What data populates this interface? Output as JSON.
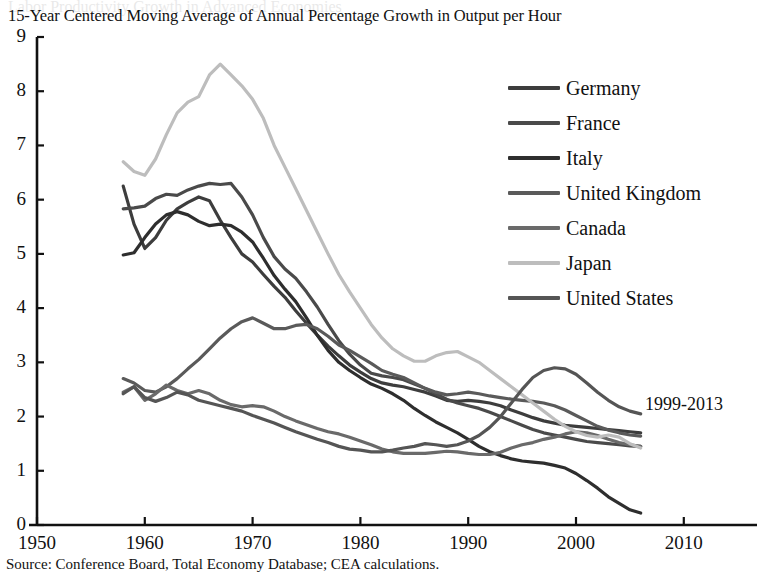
{
  "chart_data": {
    "type": "line",
    "title": "Labor Productivity Growth in Advanced Economies",
    "subtitle": "15-Year Centered Moving Average of Annual Percentage Growth in Output per Hour",
    "source": "Source: Conference Board, Total Economy Database; CEA calculations.",
    "annotation": "1999-2013",
    "xlabel": "",
    "ylabel": "",
    "xlim": [
      1950,
      2015
    ],
    "ylim": [
      0,
      9
    ],
    "xticks": [
      1950,
      1960,
      1970,
      1980,
      1990,
      2000,
      2010
    ],
    "yticks": [
      0,
      1,
      2,
      3,
      4,
      5,
      6,
      7,
      8,
      9
    ],
    "xtick_labels": [
      "1950",
      "1960",
      "1970",
      "1980",
      "1990",
      "2000",
      "2010"
    ],
    "ytick_labels": [
      "0",
      "1",
      "2",
      "3",
      "4",
      "5",
      "6",
      "7",
      "8",
      "9"
    ],
    "grid": false,
    "legend_position": "upper right",
    "x_start": 1958,
    "x_end": 2006,
    "series": [
      {
        "name": "Germany",
        "color": "#3d3d3d",
        "x": [
          1958,
          1959,
          1960,
          1961,
          1962,
          1963,
          1964,
          1965,
          1966,
          1967,
          1968,
          1969,
          1970,
          1971,
          1972,
          1973,
          1974,
          1975,
          1976,
          1977,
          1978,
          1979,
          1980,
          1981,
          1982,
          1983,
          1984,
          1985,
          1986,
          1987,
          1988,
          1989,
          1990,
          1991,
          1992,
          1993,
          1994,
          1995,
          1996,
          1997,
          1998,
          1999,
          2000,
          2001,
          2002,
          2003,
          2004,
          2005,
          2006
        ],
        "values": [
          6.25,
          5.55,
          5.1,
          5.3,
          5.62,
          5.83,
          5.95,
          6.05,
          5.98,
          5.62,
          5.3,
          5.0,
          4.85,
          4.62,
          4.4,
          4.2,
          3.95,
          3.72,
          3.5,
          3.3,
          3.12,
          2.95,
          2.82,
          2.7,
          2.62,
          2.58,
          2.55,
          2.5,
          2.45,
          2.38,
          2.3,
          2.28,
          2.3,
          2.28,
          2.25,
          2.2,
          2.12,
          2.05,
          1.98,
          1.92,
          1.88,
          1.84,
          1.82,
          1.8,
          1.78,
          1.76,
          1.74,
          1.72,
          1.7
        ]
      },
      {
        "name": "France",
        "color": "#4a4a4a",
        "x": [
          1958,
          1959,
          1960,
          1961,
          1962,
          1963,
          1964,
          1965,
          1966,
          1967,
          1968,
          1969,
          1970,
          1971,
          1972,
          1973,
          1974,
          1975,
          1976,
          1977,
          1978,
          1979,
          1980,
          1981,
          1982,
          1983,
          1984,
          1985,
          1986,
          1987,
          1988,
          1989,
          1990,
          1991,
          1992,
          1993,
          1994,
          1995,
          1996,
          1997,
          1998,
          1999,
          2000,
          2001,
          2002,
          2003,
          2004,
          2005,
          2006
        ],
        "values": [
          5.83,
          5.85,
          5.88,
          6.02,
          6.1,
          6.08,
          6.18,
          6.25,
          6.3,
          6.28,
          6.3,
          6.05,
          5.72,
          5.3,
          4.95,
          4.72,
          4.55,
          4.3,
          4.02,
          3.7,
          3.4,
          3.15,
          2.95,
          2.8,
          2.75,
          2.72,
          2.68,
          2.6,
          2.52,
          2.42,
          2.32,
          2.25,
          2.2,
          2.15,
          2.08,
          2.0,
          1.92,
          1.84,
          1.76,
          1.7,
          1.66,
          1.62,
          1.58,
          1.54,
          1.52,
          1.5,
          1.48,
          1.46,
          1.45
        ]
      },
      {
        "name": "Italy",
        "color": "#2e2e2e",
        "x": [
          1958,
          1959,
          1960,
          1961,
          1962,
          1963,
          1964,
          1965,
          1966,
          1967,
          1968,
          1969,
          1970,
          1971,
          1972,
          1973,
          1974,
          1975,
          1976,
          1977,
          1978,
          1979,
          1980,
          1981,
          1982,
          1983,
          1984,
          1985,
          1986,
          1987,
          1988,
          1989,
          1990,
          1991,
          1992,
          1993,
          1994,
          1995,
          1996,
          1997,
          1998,
          1999,
          2000,
          2001,
          2002,
          2003,
          2004,
          2005,
          2006
        ],
        "values": [
          4.98,
          5.02,
          5.3,
          5.55,
          5.72,
          5.78,
          5.72,
          5.6,
          5.52,
          5.55,
          5.52,
          5.4,
          5.22,
          4.92,
          4.6,
          4.35,
          4.12,
          3.82,
          3.5,
          3.22,
          3.0,
          2.85,
          2.72,
          2.6,
          2.52,
          2.42,
          2.3,
          2.15,
          2.02,
          1.9,
          1.8,
          1.7,
          1.58,
          1.45,
          1.35,
          1.28,
          1.22,
          1.18,
          1.16,
          1.14,
          1.1,
          1.05,
          0.95,
          0.82,
          0.68,
          0.52,
          0.4,
          0.28,
          0.22
        ]
      },
      {
        "name": "United Kingdom",
        "color": "#5a5a5a",
        "x": [
          1958,
          1959,
          1960,
          1961,
          1962,
          1963,
          1964,
          1965,
          1966,
          1967,
          1968,
          1969,
          1970,
          1971,
          1972,
          1973,
          1974,
          1975,
          1976,
          1977,
          1978,
          1979,
          1980,
          1981,
          1982,
          1983,
          1984,
          1985,
          1986,
          1987,
          1988,
          1989,
          1990,
          1991,
          1992,
          1993,
          1994,
          1995,
          1996,
          1997,
          1998,
          1999,
          2000,
          2001,
          2002,
          2003,
          2004,
          2005,
          2006
        ],
        "values": [
          2.7,
          2.62,
          2.48,
          2.45,
          2.55,
          2.7,
          2.88,
          3.05,
          3.25,
          3.45,
          3.62,
          3.75,
          3.82,
          3.72,
          3.62,
          3.62,
          3.68,
          3.7,
          3.62,
          3.48,
          3.32,
          3.22,
          3.1,
          2.98,
          2.85,
          2.78,
          2.72,
          2.62,
          2.52,
          2.45,
          2.4,
          2.42,
          2.45,
          2.42,
          2.38,
          2.35,
          2.32,
          2.3,
          2.28,
          2.25,
          2.2,
          2.12,
          2.02,
          1.92,
          1.82,
          1.75,
          1.7,
          1.66,
          1.64
        ]
      },
      {
        "name": "Canada",
        "color": "#6a6a6a",
        "x": [
          1958,
          1959,
          1960,
          1961,
          1962,
          1963,
          1964,
          1965,
          1966,
          1967,
          1968,
          1969,
          1970,
          1971,
          1972,
          1973,
          1974,
          1975,
          1976,
          1977,
          1978,
          1979,
          1980,
          1981,
          1982,
          1983,
          1984,
          1985,
          1986,
          1987,
          1988,
          1989,
          1990,
          1991,
          1992,
          1993,
          1994,
          1995,
          1996,
          1997,
          1998,
          1999,
          2000,
          2001,
          2002,
          2003,
          2004,
          2005,
          2006
        ],
        "values": [
          2.45,
          2.55,
          2.3,
          2.42,
          2.58,
          2.48,
          2.42,
          2.48,
          2.42,
          2.3,
          2.22,
          2.18,
          2.2,
          2.18,
          2.1,
          2.0,
          1.92,
          1.85,
          1.78,
          1.72,
          1.68,
          1.62,
          1.55,
          1.48,
          1.4,
          1.35,
          1.32,
          1.32,
          1.32,
          1.34,
          1.36,
          1.35,
          1.32,
          1.3,
          1.3,
          1.34,
          1.42,
          1.48,
          1.52,
          1.58,
          1.62,
          1.68,
          1.72,
          1.7,
          1.65,
          1.58,
          1.52,
          1.48,
          1.45
        ]
      },
      {
        "name": "Japan",
        "color": "#bdbdbd",
        "x": [
          1958,
          1959,
          1960,
          1961,
          1962,
          1963,
          1964,
          1965,
          1966,
          1967,
          1968,
          1969,
          1970,
          1971,
          1972,
          1973,
          1974,
          1975,
          1976,
          1977,
          1978,
          1979,
          1980,
          1981,
          1982,
          1983,
          1984,
          1985,
          1986,
          1987,
          1988,
          1989,
          1990,
          1991,
          1992,
          1993,
          1994,
          1995,
          1996,
          1997,
          1998,
          1999,
          2000,
          2001,
          2002,
          2003,
          2004,
          2005,
          2006
        ],
        "values": [
          6.7,
          6.52,
          6.45,
          6.75,
          7.2,
          7.6,
          7.8,
          7.9,
          8.3,
          8.5,
          8.3,
          8.1,
          7.85,
          7.5,
          7.0,
          6.6,
          6.2,
          5.8,
          5.4,
          5.0,
          4.62,
          4.3,
          4.0,
          3.7,
          3.45,
          3.25,
          3.12,
          3.02,
          3.02,
          3.12,
          3.18,
          3.2,
          3.1,
          3.0,
          2.85,
          2.7,
          2.55,
          2.4,
          2.25,
          2.1,
          1.95,
          1.82,
          1.72,
          1.65,
          1.62,
          1.66,
          1.62,
          1.5,
          1.42
        ]
      },
      {
        "name": "United States",
        "color": "#555555",
        "x": [
          1958,
          1959,
          1960,
          1961,
          1962,
          1963,
          1964,
          1965,
          1966,
          1967,
          1968,
          1969,
          1970,
          1971,
          1972,
          1973,
          1974,
          1975,
          1976,
          1977,
          1978,
          1979,
          1980,
          1981,
          1982,
          1983,
          1984,
          1985,
          1986,
          1987,
          1988,
          1989,
          1990,
          1991,
          1992,
          1993,
          1994,
          1995,
          1996,
          1997,
          1998,
          1999,
          2000,
          2001,
          2002,
          2003,
          2004,
          2005,
          2006
        ],
        "values": [
          2.42,
          2.55,
          2.35,
          2.28,
          2.35,
          2.45,
          2.4,
          2.3,
          2.25,
          2.2,
          2.15,
          2.1,
          2.02,
          1.95,
          1.88,
          1.8,
          1.72,
          1.65,
          1.58,
          1.52,
          1.45,
          1.4,
          1.38,
          1.35,
          1.35,
          1.38,
          1.42,
          1.45,
          1.5,
          1.48,
          1.45,
          1.48,
          1.55,
          1.65,
          1.8,
          2.0,
          2.25,
          2.5,
          2.72,
          2.85,
          2.9,
          2.88,
          2.78,
          2.62,
          2.45,
          2.3,
          2.18,
          2.1,
          2.05
        ]
      }
    ]
  }
}
